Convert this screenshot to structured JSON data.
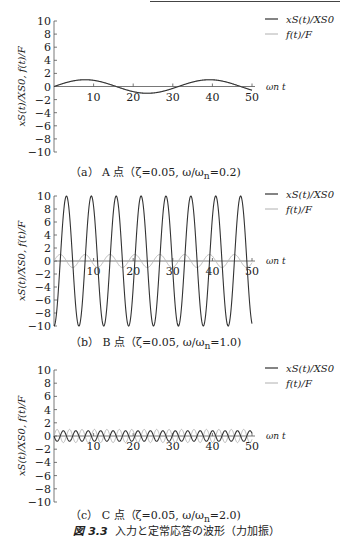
{
  "figure_caption": {
    "label": "図 3.3",
    "text": "入力と定常応答の波形（力加振）"
  },
  "axis": {
    "ylabel": "x_S(t)/X_S0, f(t)/F",
    "xlabel": "ω_n t",
    "yticks": [
      10,
      8,
      6,
      4,
      2,
      0,
      -2,
      -4,
      -6,
      -8,
      -10
    ],
    "xticks": [
      10,
      20,
      30,
      40,
      50
    ]
  },
  "legend": {
    "series1": "x_S(t)/X_S0",
    "series2": "f(t)/F"
  },
  "colors": {
    "response": "#333333",
    "force": "#b0b0b0"
  },
  "chart_data": [
    {
      "type": "line",
      "title": "(a) A 点 (ζ=0.05, ω/ω_n=0.2)",
      "xlabel": "ω_n t",
      "ylabel": "x_S(t)/X_S0, f(t)/F",
      "xlim": [
        0,
        50
      ],
      "ylim": [
        -10,
        10
      ],
      "series": [
        {
          "name": "x_S(t)/X_S0",
          "amplitude": 1.04,
          "omega": 0.2,
          "phase": "sin",
          "description": "≈1.04·sin(0.2t)"
        },
        {
          "name": "f(t)/F",
          "amplitude": 1.0,
          "omega": 0.2,
          "phase": "sin"
        }
      ]
    },
    {
      "type": "line",
      "title": "(b) B 点 (ζ=0.05, ω/ω_n=1.0)",
      "xlabel": "ω_n t",
      "ylabel": "x_S(t)/X_S0, f(t)/F",
      "xlim": [
        0,
        50
      ],
      "ylim": [
        -10,
        10
      ],
      "series": [
        {
          "name": "x_S(t)/X_S0",
          "amplitude": 10,
          "omega": 1.0,
          "phase": "-cos",
          "description": "≈-10·cos(t)"
        },
        {
          "name": "f(t)/F",
          "amplitude": 1.0,
          "omega": 1.0,
          "phase": "sin"
        }
      ]
    },
    {
      "type": "line",
      "title": "(c) C 点 (ζ=0.05, ω/ω_n=2.0)",
      "xlabel": "ω_n t",
      "ylabel": "x_S(t)/X_S0, f(t)/F",
      "xlim": [
        0,
        50
      ],
      "ylim": [
        -10,
        10
      ],
      "series": [
        {
          "name": "x_S(t)/X_S0",
          "amplitude": 0.8,
          "omega": 2.0,
          "phase": "-sin",
          "description": "anti-phase ≈ -0.8·sin(2t)"
        },
        {
          "name": "f(t)/F",
          "amplitude": 1.0,
          "omega": 2.0,
          "phase": "sin"
        }
      ]
    }
  ],
  "panels": [
    {
      "caption": "（a） A 点（ζ=0.05, ω/ω",
      "caption_sub": "n",
      "caption_end": "=0.2)"
    },
    {
      "caption": "（b） B 点（ζ=0.05, ω/ω",
      "caption_sub": "n",
      "caption_end": "=1.0)"
    },
    {
      "caption": "（c） C 点（ζ=0.05, ω/ω",
      "caption_sub": "n",
      "caption_end": "=2.0)"
    }
  ]
}
